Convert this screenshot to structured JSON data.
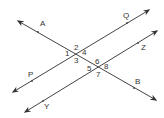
{
  "diagram": {
    "type": "parallel-lines-transversal",
    "line_color": "#444444",
    "text_color": "#333333",
    "lines": [
      {
        "name": "line-PQ",
        "from": [
          13,
          92
        ],
        "to": [
          149,
          10
        ],
        "labels": [
          "P",
          "Q"
        ]
      },
      {
        "name": "line-YZ",
        "from": [
          25,
          112
        ],
        "to": [
          157,
          31
        ],
        "labels": [
          "Y",
          "Z"
        ]
      },
      {
        "name": "line-AB",
        "from": [
          18,
          21
        ],
        "to": [
          156,
          100
        ],
        "labels": [
          "A",
          "B"
        ]
      }
    ],
    "points": [
      {
        "label": "A",
        "dot": [
          38,
          32
        ],
        "text": [
          40,
          26
        ]
      },
      {
        "label": "Q",
        "dot": [
          127,
          23
        ],
        "text": [
          123,
          18
        ]
      },
      {
        "label": "P",
        "dot": [
          32,
          81
        ],
        "text": [
          28,
          77
        ]
      },
      {
        "label": "Z",
        "dot": [
          138,
          43
        ],
        "text": [
          141,
          50
        ]
      },
      {
        "label": "B",
        "dot": [
          134,
          88
        ],
        "text": [
          135,
          84
        ]
      },
      {
        "label": "Y",
        "dot": [
          43,
          101
        ],
        "text": [
          44,
          109
        ]
      }
    ],
    "angle_labels": [
      {
        "label": "1",
        "pos": [
          65,
          56
        ]
      },
      {
        "label": "2",
        "pos": [
          74,
          50
        ]
      },
      {
        "label": "3",
        "pos": [
          74,
          63
        ]
      },
      {
        "label": "4",
        "pos": [
          82,
          55
        ]
      },
      {
        "label": "5",
        "pos": [
          87,
          71
        ]
      },
      {
        "label": "6",
        "pos": [
          95,
          64
        ]
      },
      {
        "label": "7",
        "pos": [
          96,
          77
        ]
      },
      {
        "label": "8",
        "pos": [
          104,
          69
        ]
      }
    ]
  }
}
